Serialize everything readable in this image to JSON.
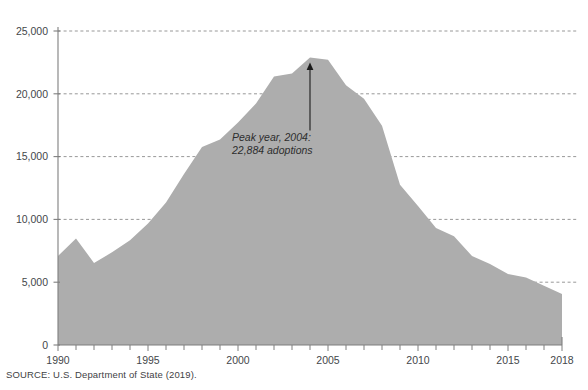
{
  "source_note": "SOURCE: U.S. Department of State (2019).",
  "annotation": {
    "line1": "Peak year, 2004:",
    "line2": "22,884 adoptions"
  },
  "colors": {
    "area_fill": "#adadad",
    "axis": "#7f7f7f",
    "gridline": "#8c8c8c",
    "text": "#3f4245",
    "annotation_line": "#1a1a1a",
    "background": "#ffffff"
  },
  "chart_data": {
    "type": "area",
    "title": "",
    "subtitle": "",
    "xlabel": "",
    "ylabel": "",
    "xlim": [
      1990,
      2018
    ],
    "ylim": [
      0,
      25000
    ],
    "grid": true,
    "legend": "none",
    "ytick_labels": [
      "0",
      "5,000",
      "10,000",
      "15,000",
      "20,000",
      "25,000"
    ],
    "ytick_values": [
      0,
      5000,
      10000,
      15000,
      20000,
      25000
    ],
    "xtick_labels": [
      "1990",
      "1995",
      "2000",
      "2005",
      "2010",
      "2015",
      "2018"
    ],
    "xtick_values": [
      1990,
      1995,
      2000,
      2005,
      2010,
      2015,
      2018
    ],
    "x_minor_step": 1,
    "series": [
      {
        "name": "International adoptions to the United States",
        "x": [
          1990,
          1991,
          1992,
          1993,
          1994,
          1995,
          1996,
          1997,
          1998,
          1999,
          2000,
          2001,
          2002,
          2003,
          2004,
          2005,
          2006,
          2007,
          2008,
          2009,
          2010,
          2011,
          2012,
          2013,
          2014,
          2015,
          2016,
          2017,
          2018
        ],
        "values": [
          7093,
          8481,
          6536,
          7377,
          8333,
          9679,
          11340,
          13621,
          15774,
          16363,
          17718,
          19237,
          21378,
          21616,
          22884,
          22710,
          20680,
          19601,
          17449,
          12753,
          11059,
          9320,
          8668,
          7094,
          6441,
          5648,
          5372,
          4714,
          4059
        ]
      }
    ],
    "annotations": [
      {
        "text": "Peak year, 2004: 22,884 adoptions",
        "point_x": 2004,
        "point_y": 22884
      }
    ]
  }
}
